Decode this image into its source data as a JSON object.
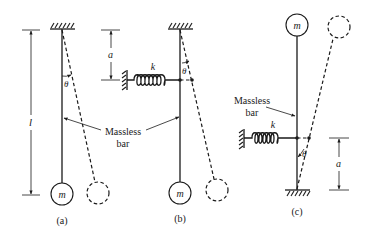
{
  "figure": {
    "background": "#ffffff",
    "ink_color": "#1a1a1a",
    "panels": [
      {
        "id": "a",
        "caption": "(a)",
        "mass_label": "m",
        "length_label": "l",
        "angle_label": "θ",
        "bar_label_line1": "Massless",
        "bar_label_line2": "bar"
      },
      {
        "id": "b",
        "caption": "(b)",
        "mass_label": "m",
        "spring_label": "k",
        "offset_label": "a",
        "angle_label": "θ"
      },
      {
        "id": "c",
        "caption": "(c)",
        "mass_label": "m",
        "spring_label": "k",
        "offset_label": "a",
        "angle_label": "θ",
        "bar_label_line1": "Massless",
        "bar_label_line2": "bar"
      }
    ]
  }
}
